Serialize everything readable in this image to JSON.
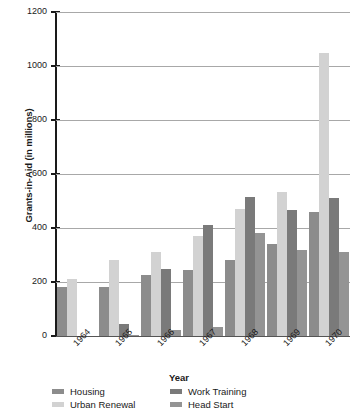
{
  "chart_data": {
    "type": "bar",
    "title": "",
    "xlabel": "Year",
    "ylabel": "Grants-in-Aid (in millions)",
    "categories": [
      "1964",
      "1965",
      "1966",
      "1967",
      "1968",
      "1969",
      "1970"
    ],
    "ylim": [
      0,
      1200
    ],
    "yticks": [
      0,
      200,
      400,
      600,
      800,
      1000,
      1200
    ],
    "ytick_labels": [
      "0",
      "200",
      "400",
      "600",
      "800",
      "1000",
      "1200"
    ],
    "grid": true,
    "legend_position": "bottom",
    "series": [
      {
        "name": "Housing",
        "color": "#8c8c8c",
        "values": [
          180,
          180,
          225,
          245,
          280,
          340,
          460
        ]
      },
      {
        "name": "Urban Renewal",
        "color": "#d2d2d2",
        "values": [
          210,
          280,
          310,
          370,
          470,
          535,
          1050
        ]
      },
      {
        "name": "Work Training",
        "color": "#7a7a7a",
        "values": [
          0,
          45,
          250,
          410,
          515,
          465,
          510
        ]
      },
      {
        "name": "Head Start",
        "color": "#949494",
        "values": [
          0,
          3,
          22,
          35,
          380,
          320,
          310
        ]
      }
    ]
  }
}
